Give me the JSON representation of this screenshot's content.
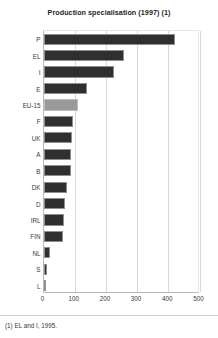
{
  "figure": {
    "title": "Production specialisation (1997) (1)",
    "footnote": "(1) EL and I, 1995."
  },
  "colors": {
    "bar": "#2f2f2f",
    "bar_highlight": "#9a9a9a",
    "grid": "#d8d8d8",
    "text": "#231f20"
  },
  "chart_data": {
    "type": "bar",
    "orientation": "horizontal",
    "title": "Production specialisation (1997) (1)",
    "xlabel": "",
    "ylabel": "",
    "xlim": [
      0,
      500
    ],
    "xticks": [
      "0",
      "100",
      "200",
      "300",
      "400",
      "500"
    ],
    "grid": true,
    "legend": "none",
    "highlight_category": "EU-15",
    "categories": [
      "P",
      "EL",
      "I",
      "E",
      "EU-15",
      "F",
      "UK",
      "A",
      "B",
      "DK",
      "D",
      "IRL",
      "FIN",
      "NL",
      "S",
      "L"
    ],
    "values": [
      421,
      257,
      226,
      140,
      110,
      96,
      90,
      89,
      88,
      76,
      69,
      67,
      61,
      22,
      11,
      3
    ],
    "notes": "(1) EL and I, 1995."
  }
}
